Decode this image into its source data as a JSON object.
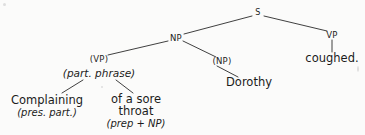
{
  "figure": {
    "kind": "syntax-tree-diagram",
    "background_color": "#fbfbfa",
    "ink_color": "#1b1b1b"
  },
  "tree": {
    "nodes": {
      "s": {
        "label": "S",
        "x": 258,
        "y": 13
      },
      "np_top": {
        "label": "NP",
        "x": 176,
        "y": 38
      },
      "vp_right": {
        "label": "VP",
        "x": 332,
        "y": 35
      },
      "vp_paren": {
        "label": "(VP)",
        "x": 99,
        "y": 59
      },
      "part_phrase": {
        "label": "(part. phrase)",
        "x": 99,
        "y": 74
      },
      "np_paren": {
        "label": "(NP)",
        "x": 222,
        "y": 61
      },
      "dorothy": {
        "label": "Dorothy",
        "x": 249,
        "y": 82
      },
      "coughed": {
        "label": "coughed.",
        "x": 332,
        "y": 58
      },
      "complaining_word": {
        "label": "Complaining",
        "x": 47,
        "y": 100
      },
      "complaining_gloss": {
        "label": "(pres. part.)",
        "x": 47,
        "y": 113
      },
      "prep_line1": {
        "label": "of a sore",
        "x": 136,
        "y": 99
      },
      "prep_line2": {
        "label": "throat",
        "x": 136,
        "y": 111
      },
      "prep_gloss": {
        "label": "(prep + NP)",
        "x": 136,
        "y": 124
      }
    },
    "edges": [
      {
        "name": "s-to-np",
        "x1": 252,
        "y1": 16,
        "x2": 184,
        "y2": 34
      },
      {
        "name": "s-to-vp",
        "x1": 264,
        "y1": 16,
        "x2": 327,
        "y2": 31
      },
      {
        "name": "np-to-vp-paren",
        "x1": 168,
        "y1": 41,
        "x2": 108,
        "y2": 55
      },
      {
        "name": "np-to-np-paren",
        "x1": 183,
        "y1": 41,
        "x2": 216,
        "y2": 57
      },
      {
        "name": "vp-to-coughed",
        "x1": 332,
        "y1": 40,
        "x2": 332,
        "y2": 52
      },
      {
        "name": "np-paren-to-dorothy",
        "x1": 217,
        "y1": 66,
        "x2": 238,
        "y2": 77
      },
      {
        "name": "part-phrase-to-complaining",
        "x1": 83,
        "y1": 80,
        "x2": 62,
        "y2": 93
      },
      {
        "name": "part-phrase-to-prep",
        "x1": 116,
        "y1": 80,
        "x2": 133,
        "y2": 93
      }
    ]
  },
  "sentence": {
    "text": "Complaining of a sore throat, Dorothy coughed."
  }
}
